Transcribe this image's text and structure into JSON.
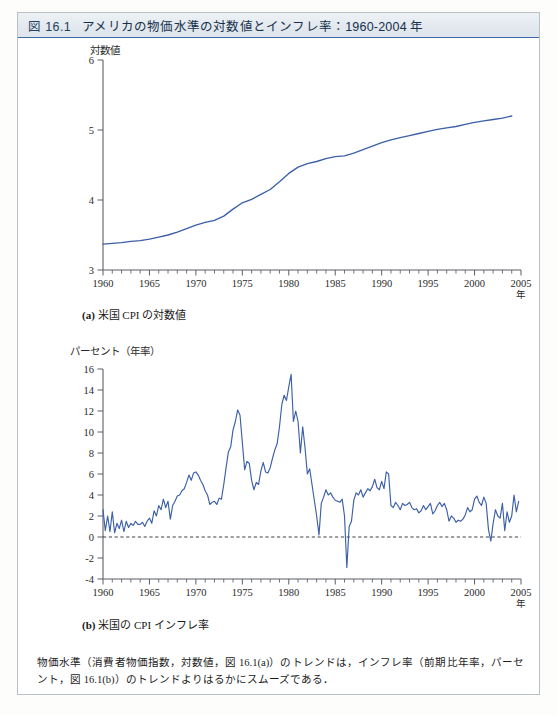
{
  "figure": {
    "number_label": "図 16.1",
    "title": "アメリカの物価水準の対数値とインフレ率：1960-2004 年",
    "note": "物価水準（消費者物価指数，対数値，図 16.1(a)）のトレンドは，インフレ率（前期比年率，パーセント，図 16.1(b)）のトレンドよりはるかにスムーズである．",
    "accent_color": "#3f67ab",
    "series_color": "#3b5fa8",
    "header_background": "#e3e9ef"
  },
  "panel_a": {
    "caption_tag": "(a)",
    "caption_text": "米国 CPI の対数値",
    "y_axis_label": "対数値",
    "x_axis_unit": "年"
  },
  "panel_b": {
    "caption_tag": "(b)",
    "caption_text": "米国の CPI インフレ率",
    "y_axis_label": "パーセント（年率）",
    "x_axis_unit": "年"
  },
  "chart_data": [
    {
      "id": "panel_a",
      "type": "line",
      "title": "(a) 米国 CPI の対数値",
      "xlabel": "年",
      "ylabel": "対数値",
      "xlim": [
        1960,
        2005
      ],
      "ylim": [
        3,
        6
      ],
      "yticks": [
        3,
        4,
        5,
        6
      ],
      "xticks": [
        1960,
        1965,
        1970,
        1975,
        1980,
        1985,
        1990,
        1995,
        2000,
        2005
      ],
      "x_minor_step": 1,
      "grid": false,
      "legend": "none",
      "x": [
        1960,
        1961,
        1962,
        1963,
        1964,
        1965,
        1966,
        1967,
        1968,
        1969,
        1970,
        1971,
        1972,
        1973,
        1974,
        1975,
        1976,
        1977,
        1978,
        1979,
        1980,
        1981,
        1982,
        1983,
        1984,
        1985,
        1986,
        1987,
        1988,
        1989,
        1990,
        1991,
        1992,
        1993,
        1994,
        1995,
        1996,
        1997,
        1998,
        1999,
        2000,
        2001,
        2002,
        2003,
        2004
      ],
      "values": [
        3.37,
        3.38,
        3.39,
        3.41,
        3.42,
        3.44,
        3.47,
        3.5,
        3.54,
        3.59,
        3.64,
        3.68,
        3.71,
        3.77,
        3.87,
        3.96,
        4.01,
        4.08,
        4.15,
        4.26,
        4.38,
        4.47,
        4.52,
        4.55,
        4.59,
        4.62,
        4.63,
        4.67,
        4.72,
        4.77,
        4.82,
        4.86,
        4.89,
        4.92,
        4.95,
        4.98,
        5.01,
        5.03,
        5.05,
        5.08,
        5.11,
        5.13,
        5.15,
        5.17,
        5.2
      ]
    },
    {
      "id": "panel_b",
      "type": "line",
      "title": "(b) 米国の CPI インフレ率",
      "xlabel": "年",
      "ylabel": "パーセント（年率）",
      "xlim": [
        1960,
        2005
      ],
      "ylim": [
        -4,
        16
      ],
      "yticks": [
        -4,
        -2,
        0,
        2,
        4,
        6,
        8,
        10,
        12,
        14,
        16
      ],
      "xticks": [
        1960,
        1965,
        1970,
        1975,
        1980,
        1985,
        1990,
        1995,
        2000,
        2005
      ],
      "x_minor_step": 1,
      "grid": false,
      "reference_line": 0,
      "legend": "none",
      "frequency": "quarterly",
      "x": [
        1960.0,
        1960.25,
        1960.5,
        1960.75,
        1961.0,
        1961.25,
        1961.5,
        1961.75,
        1962.0,
        1962.25,
        1962.5,
        1962.75,
        1963.0,
        1963.25,
        1963.5,
        1963.75,
        1964.0,
        1964.25,
        1964.5,
        1964.75,
        1965.0,
        1965.25,
        1965.5,
        1965.75,
        1966.0,
        1966.25,
        1966.5,
        1966.75,
        1967.0,
        1967.25,
        1967.5,
        1967.75,
        1968.0,
        1968.25,
        1968.5,
        1968.75,
        1969.0,
        1969.25,
        1969.5,
        1969.75,
        1970.0,
        1970.25,
        1970.5,
        1970.75,
        1971.0,
        1971.25,
        1971.5,
        1971.75,
        1972.0,
        1972.25,
        1972.5,
        1972.75,
        1973.0,
        1973.25,
        1973.5,
        1973.75,
        1974.0,
        1974.25,
        1974.5,
        1974.75,
        1975.0,
        1975.25,
        1975.5,
        1975.75,
        1976.0,
        1976.25,
        1976.5,
        1976.75,
        1977.0,
        1977.25,
        1977.5,
        1977.75,
        1978.0,
        1978.25,
        1978.5,
        1978.75,
        1979.0,
        1979.25,
        1979.5,
        1979.75,
        1980.0,
        1980.25,
        1980.5,
        1980.75,
        1981.0,
        1981.25,
        1981.5,
        1981.75,
        1982.0,
        1982.25,
        1982.5,
        1982.75,
        1983.0,
        1983.25,
        1983.5,
        1983.75,
        1984.0,
        1984.25,
        1984.5,
        1984.75,
        1985.0,
        1985.25,
        1985.5,
        1985.75,
        1986.0,
        1986.25,
        1986.5,
        1986.75,
        1987.0,
        1987.25,
        1987.5,
        1987.75,
        1988.0,
        1988.25,
        1988.5,
        1988.75,
        1989.0,
        1989.25,
        1989.5,
        1989.75,
        1990.0,
        1990.25,
        1990.5,
        1990.75,
        1991.0,
        1991.25,
        1991.5,
        1991.75,
        1992.0,
        1992.25,
        1992.5,
        1992.75,
        1993.0,
        1993.25,
        1993.5,
        1993.75,
        1994.0,
        1994.25,
        1994.5,
        1994.75,
        1995.0,
        1995.25,
        1995.5,
        1995.75,
        1996.0,
        1996.25,
        1996.5,
        1996.75,
        1997.0,
        1997.25,
        1997.5,
        1997.75,
        1998.0,
        1998.25,
        1998.5,
        1998.75,
        1999.0,
        1999.25,
        1999.5,
        1999.75,
        2000.0,
        2000.25,
        2000.5,
        2000.75,
        2001.0,
        2001.25,
        2001.5,
        2001.75,
        2002.0,
        2002.25,
        2002.5,
        2002.75,
        2003.0,
        2003.25,
        2003.5,
        2003.75,
        2004.0,
        2004.25,
        2004.5,
        2004.75
      ],
      "values": [
        2.6,
        0.6,
        2.0,
        0.5,
        2.4,
        0.4,
        1.3,
        0.8,
        1.6,
        0.5,
        1.5,
        0.9,
        1.3,
        1.1,
        1.5,
        1.2,
        1.2,
        1.4,
        1.0,
        1.5,
        1.8,
        1.3,
        2.5,
        2.0,
        3.0,
        2.6,
        3.6,
        2.8,
        3.4,
        1.7,
        3.0,
        3.4,
        3.9,
        4.0,
        4.4,
        4.6,
        5.2,
        5.9,
        5.4,
        6.1,
        6.2,
        5.9,
        5.4,
        5.0,
        4.4,
        4.0,
        3.1,
        3.3,
        3.4,
        3.1,
        3.7,
        3.6,
        5.0,
        6.6,
        8.1,
        8.6,
        10.2,
        11.0,
        12.1,
        11.6,
        9.0,
        6.4,
        7.2,
        7.0,
        5.4,
        4.5,
        5.2,
        5.0,
        6.3,
        7.1,
        6.2,
        6.1,
        6.6,
        7.5,
        8.3,
        8.9,
        10.5,
        12.6,
        13.5,
        13.0,
        14.3,
        15.5,
        11.0,
        12.0,
        11.0,
        8.0,
        10.5,
        8.5,
        6.0,
        6.5,
        5.0,
        3.5,
        2.0,
        0.2,
        3.2,
        3.8,
        4.5,
        4.0,
        4.2,
        3.8,
        3.5,
        3.4,
        3.3,
        3.6,
        2.0,
        -2.9,
        1.0,
        1.5,
        3.5,
        4.2,
        4.0,
        4.5,
        3.8,
        4.2,
        4.6,
        4.4,
        4.8,
        5.5,
        4.7,
        4.5,
        5.3,
        4.6,
        6.2,
        6.0,
        3.0,
        2.8,
        3.3,
        3.0,
        2.6,
        3.2,
        3.0,
        3.1,
        3.3,
        2.8,
        2.6,
        2.7,
        2.3,
        2.5,
        3.0,
        2.6,
        2.9,
        3.2,
        2.2,
        2.5,
        3.0,
        3.3,
        2.9,
        3.2,
        2.6,
        1.5,
        2.0,
        1.8,
        1.4,
        1.6,
        1.5,
        1.7,
        2.1,
        2.8,
        2.4,
        2.6,
        3.6,
        3.9,
        3.3,
        3.0,
        3.8,
        3.2,
        0.7,
        -0.4,
        1.3,
        2.6,
        2.0,
        1.8,
        3.2,
        0.6,
        2.4,
        1.4,
        2.0,
        4.0,
        2.4,
        3.4
      ]
    }
  ]
}
